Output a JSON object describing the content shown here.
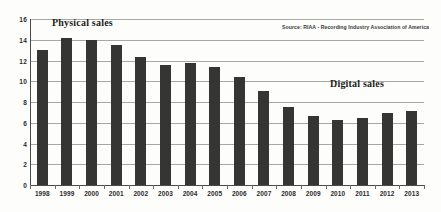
{
  "chart_data": {
    "type": "bar",
    "title": "",
    "subtitle": "",
    "xlabel": "",
    "ylabel": "",
    "ylim": [
      0,
      16
    ],
    "yticks": [
      0,
      2,
      4,
      6,
      8,
      10,
      12,
      14,
      16
    ],
    "grid": true,
    "legend_position": "none",
    "categories": [
      "1998",
      "1999",
      "2000",
      "2001",
      "2002",
      "2003",
      "2004",
      "2005",
      "2006",
      "2007",
      "2008",
      "2009",
      "2010",
      "2011",
      "2012",
      "2013"
    ],
    "values": [
      13.0,
      14.2,
      14.0,
      13.45,
      12.3,
      11.55,
      11.75,
      11.35,
      10.45,
      9.05,
      7.55,
      6.65,
      6.3,
      6.5,
      6.9,
      7.1
    ],
    "series": [
      {
        "name": "Sales",
        "values": [
          13.0,
          14.2,
          14.0,
          13.45,
          12.3,
          11.55,
          11.75,
          11.35,
          10.45,
          9.05,
          7.55,
          6.65,
          6.3,
          6.5,
          6.9,
          7.1
        ]
      }
    ],
    "annotations": [
      {
        "name": "physical-sales",
        "text": "Physical sales"
      },
      {
        "name": "digital-sales",
        "text": "Digital sales"
      }
    ],
    "source_note": "Source: RIAA - Recording Industry Association of America",
    "colors": {
      "bar": "#353533",
      "gridline": "#a9a9a4",
      "axis": "#4a4a46",
      "text": "#1d1d1b",
      "background": "#fdfdfb"
    }
  }
}
